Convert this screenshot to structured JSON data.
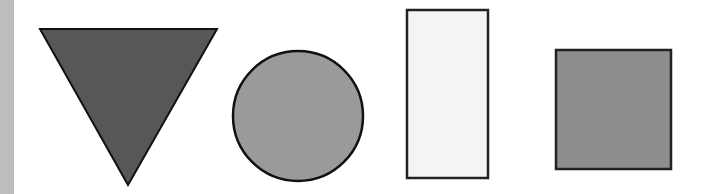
{
  "canvas": {
    "width": 704,
    "height": 194,
    "background": "#ffffff"
  },
  "left_strip": {
    "color": "#bdbdbd",
    "width": 14
  },
  "shapes": [
    {
      "type": "triangle-down",
      "points": "40,29 217,29 128,185",
      "fill": "#575757",
      "stroke": "#111111",
      "stroke_width": 2
    },
    {
      "type": "circle",
      "cx": 298,
      "cy": 116,
      "r": 65,
      "fill": "#9a9a9a",
      "stroke": "#111111",
      "stroke_width": 2.5
    },
    {
      "type": "rectangle",
      "x": 407,
      "y": 10,
      "width": 81,
      "height": 168,
      "fill": "#f4f4f4",
      "stroke": "#222222",
      "stroke_width": 2.5
    },
    {
      "type": "square",
      "x": 556,
      "y": 50,
      "width": 115,
      "height": 119,
      "fill": "#8d8d8d",
      "stroke": "#222222",
      "stroke_width": 2.5
    }
  ]
}
